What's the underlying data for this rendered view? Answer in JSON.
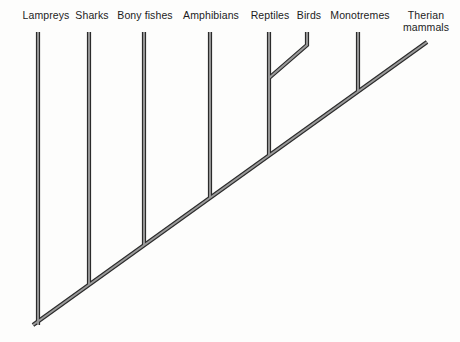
{
  "diagram": {
    "type": "cladogram",
    "background_color": "#fdfdfc",
    "line_dark_color": "#2b2b2b",
    "line_fill_color": "#9a9a9a",
    "label_color": "#1c1c1c",
    "width": 460,
    "height": 342
  },
  "taxa": [
    {
      "id": "lampreys",
      "label": "Lampreys",
      "label_x": 46,
      "label_y": 10,
      "tip_x": 38,
      "tip_y": 32,
      "join_y": 325,
      "lines": 1
    },
    {
      "id": "sharks",
      "label": "Sharks",
      "label_x": 92,
      "label_y": 10,
      "tip_x": 89,
      "tip_y": 32,
      "join_y": 290,
      "lines": 1
    },
    {
      "id": "bony-fishes",
      "label": "Bony fishes",
      "label_x": 145,
      "label_y": 10,
      "tip_x": 144,
      "tip_y": 32,
      "join_y": 247,
      "lines": 1
    },
    {
      "id": "amphibians",
      "label": "Amphibians",
      "label_x": 211,
      "label_y": 10,
      "tip_x": 210,
      "tip_y": 32,
      "join_y": 195,
      "lines": 1
    },
    {
      "id": "reptiles",
      "label": "Reptiles",
      "label_x": 270,
      "label_y": 10,
      "tip_x": 269,
      "tip_y": 32,
      "join_y": 155,
      "lines": 1
    },
    {
      "id": "birds",
      "label": "Birds",
      "label_x": 309,
      "label_y": 10,
      "tip_x": 307,
      "tip_y": 32,
      "join_y": 78,
      "lines": 1
    },
    {
      "id": "monotremes",
      "label": "Monotremes",
      "label_x": 360,
      "label_y": 10,
      "tip_x": 358,
      "tip_y": 32,
      "join_y": 88,
      "lines": 1
    },
    {
      "id": "therian",
      "label": "Therian\nmammals",
      "label_x": 426,
      "label_y": 10,
      "tip_x": 427,
      "tip_y": 42,
      "join_y": 42,
      "lines": 2
    }
  ],
  "geometry": {
    "spine": {
      "root_x": 33,
      "root_y": 325,
      "tip_x": 427,
      "tip_y": 42
    },
    "birds_branch": {
      "tip_x": 307,
      "tip_y": 32,
      "bend_x": 307,
      "bend_y": 45,
      "node_x": 269,
      "node_y": 78
    },
    "stroke_width": 4.2,
    "inner_width": 1.9
  }
}
